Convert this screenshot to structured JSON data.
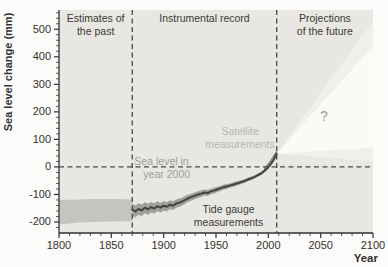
{
  "figure": {
    "page_bg": "#fcfbf9"
  },
  "colors": {
    "plot_bg": "#e8e7e3",
    "cone_outer": "#f0efeb",
    "cone_inner": "#fafaf7",
    "past_band": "#c5c4c0",
    "tide_band": "#a09f9b",
    "tide_line": "#45433f",
    "satellite": "#85847f",
    "dashed": "#4a4845",
    "axis": "#33322f",
    "text_dark": "#3b3a35",
    "text_gray": "#9e9d98",
    "text_light": "#b7b6b2"
  },
  "chart_data": {
    "type": "area",
    "title": "",
    "xlabel": "Year",
    "ylabel": "Sea level change (mm)",
    "xlim": [
      1800,
      2100
    ],
    "ylim": [
      -240,
      570
    ],
    "x_ticks": [
      1800,
      1850,
      1900,
      1950,
      2000,
      2050,
      2100
    ],
    "y_ticks": [
      -200,
      -100,
      0,
      100,
      200,
      300,
      400,
      500
    ],
    "x_minor_step": 10,
    "y_minor_step": 20,
    "grid": false,
    "legend": "none",
    "zero_reference_mm": 0,
    "dividers_year": [
      1870,
      2008
    ],
    "sections": [
      {
        "label_lines": [
          "Estimates of",
          "the past"
        ],
        "from": 1800,
        "to": 1870
      },
      {
        "label_lines": [
          "Instrumental record"
        ],
        "from": 1870,
        "to": 2008
      },
      {
        "label_lines": [
          "Projections",
          "of the future"
        ],
        "from": 2008,
        "to": 2100
      }
    ],
    "series": {
      "past_estimates_band": {
        "x": [
          1800,
          1810,
          1820,
          1830,
          1840,
          1850,
          1860,
          1870
        ],
        "upper": [
          -120,
          -119,
          -118,
          -117,
          -117,
          -116,
          -116,
          -118
        ],
        "lower": [
          -208,
          -205,
          -202,
          -200,
          -199,
          -198,
          -197,
          -196
        ]
      },
      "tide_gauge": {
        "x": [
          1870,
          1873,
          1876,
          1879,
          1882,
          1885,
          1888,
          1891,
          1894,
          1897,
          1900,
          1903,
          1906,
          1909,
          1912,
          1915,
          1918,
          1921,
          1924,
          1927,
          1930,
          1933,
          1936,
          1939,
          1942,
          1945,
          1948,
          1951,
          1954,
          1957,
          1960,
          1963,
          1966,
          1969,
          1972,
          1975,
          1978,
          1981,
          1984,
          1987,
          1990,
          1993,
          1996,
          1999,
          2002,
          2005,
          2008
        ],
        "y": [
          -155,
          -162,
          -153,
          -158,
          -148,
          -154,
          -146,
          -151,
          -143,
          -148,
          -141,
          -145,
          -137,
          -141,
          -133,
          -130,
          -125,
          -119,
          -113,
          -109,
          -104,
          -100,
          -97,
          -93,
          -95,
          -89,
          -86,
          -82,
          -78,
          -74,
          -71,
          -68,
          -65,
          -61,
          -58,
          -54,
          -50,
          -45,
          -41,
          -36,
          -30,
          -24,
          -15,
          -5,
          8,
          25,
          48
        ],
        "band_halfwidth": [
          22,
          22,
          21,
          21,
          20,
          20,
          19,
          19,
          18,
          18,
          17,
          17,
          16,
          16,
          15,
          15,
          14,
          14,
          13,
          13,
          12,
          12,
          12,
          11,
          11,
          10,
          10,
          10,
          9,
          9,
          9,
          8,
          8,
          8,
          8,
          7,
          7,
          7,
          7,
          6,
          6,
          6,
          6,
          5,
          5,
          5,
          5
        ]
      },
      "satellite_segment": {
        "polygon": [
          [
            1996,
            -12
          ],
          [
            2002,
            12
          ],
          [
            2008,
            50
          ],
          [
            2008,
            62
          ],
          [
            2001,
            20
          ],
          [
            1996,
            -4
          ]
        ]
      },
      "projection_cone": {
        "outer": [
          [
            2008,
            48
          ],
          [
            2100,
            530
          ],
          [
            2100,
            20
          ]
        ],
        "inner": [
          [
            2008,
            48
          ],
          [
            2100,
            440
          ],
          [
            2100,
            70
          ]
        ]
      }
    },
    "annotations": [
      {
        "name": "satellite-measurements-label",
        "lines": [
          "Satellite",
          "measurements"
        ],
        "year": 1973,
        "mm": 130,
        "anchor": "middle",
        "color": "text_light",
        "size": 10.5
      },
      {
        "name": "sea-level-2000-label",
        "lines": [
          "Sea level in",
          "year 2000"
        ],
        "year": 1872,
        "mm": 21,
        "anchor": "start",
        "color": "text_gray",
        "size": 10.5,
        "indent2": 9
      },
      {
        "name": "tide-gauge-label",
        "lines": [
          "Tide gauge",
          "measurements"
        ],
        "year": 1962,
        "mm": -156,
        "anchor": "middle",
        "color": "text_dark",
        "size": 10.5
      },
      {
        "name": "projection-uncertainty-question",
        "lines": [
          "?"
        ],
        "year": 2053,
        "mm": 178,
        "anchor": "middle",
        "color": "text_gray",
        "size": 14
      }
    ]
  }
}
